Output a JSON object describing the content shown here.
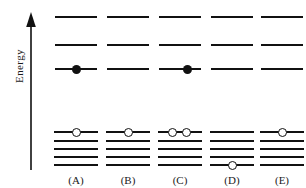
{
  "figure": {
    "type": "energy-level-diagram",
    "width": 306,
    "height": 188,
    "background_color": "#ffffff",
    "line_color": "#111111"
  },
  "axis": {
    "label": "Energy",
    "direction": "up",
    "arrow_icon": "up-arrow-icon"
  },
  "legend": {
    "filled_marker_meaning": "electron in upper level",
    "open_marker_meaning": "electron in lower level"
  },
  "levels": {
    "upper_count": 3,
    "lower_count": 5,
    "upper_y": [
      16,
      44,
      68
    ],
    "lower_y": [
      131,
      140,
      148,
      156,
      164
    ]
  },
  "columns": [
    {
      "id": "A",
      "caption": "(A)",
      "x": 6,
      "upper_electrons": [
        {
          "level_index": 2,
          "type": "filled",
          "offset_pct": 50
        }
      ],
      "lower_electrons": [
        {
          "level_index": 0,
          "type": "open",
          "offset_pct": 50
        }
      ]
    },
    {
      "id": "B",
      "caption": "(B)",
      "x": 58,
      "upper_electrons": [],
      "lower_electrons": [
        {
          "level_index": 0,
          "type": "open",
          "offset_pct": 50
        }
      ]
    },
    {
      "id": "C",
      "caption": "(C)",
      "x": 110,
      "upper_electrons": [
        {
          "level_index": 2,
          "type": "filled",
          "offset_pct": 64
        }
      ],
      "lower_electrons": [
        {
          "level_index": 0,
          "type": "open",
          "offset_pct": 36
        },
        {
          "level_index": 0,
          "type": "open",
          "offset_pct": 62
        }
      ]
    },
    {
      "id": "D",
      "caption": "(D)",
      "x": 162,
      "upper_electrons": [],
      "lower_electrons": [
        {
          "level_index": 4,
          "type": "open",
          "offset_pct": 50
        }
      ]
    },
    {
      "id": "E",
      "caption": "(E)",
      "x": 212,
      "upper_electrons": [],
      "lower_electrons": [
        {
          "level_index": 0,
          "type": "open",
          "offset_pct": 50
        }
      ]
    }
  ],
  "chart_data": {
    "type": "scatter",
    "title": "",
    "xlabel": "",
    "ylabel": "Energy",
    "grid": false,
    "legend_position": "none",
    "categories": [
      "(A)",
      "(B)",
      "(C)",
      "(D)",
      "(E)"
    ],
    "series": [
      {
        "name": "upper-level occupancy (filled)",
        "values": [
          1,
          0,
          1,
          0,
          0
        ]
      },
      {
        "name": "lower-level occupancy (open)",
        "values": [
          1,
          1,
          2,
          1,
          1
        ]
      }
    ],
    "per_option": [
      {
        "option": "(A)",
        "upper_levels": 3,
        "lower_levels": 5,
        "filled_on_upper_level": 3,
        "open_on_lower_level": 1,
        "open_count": 1
      },
      {
        "option": "(B)",
        "upper_levels": 3,
        "lower_levels": 5,
        "filled_on_upper_level": null,
        "open_on_lower_level": 1,
        "open_count": 1
      },
      {
        "option": "(C)",
        "upper_levels": 3,
        "lower_levels": 5,
        "filled_on_upper_level": 3,
        "open_on_lower_level": 1,
        "open_count": 2
      },
      {
        "option": "(D)",
        "upper_levels": 3,
        "lower_levels": 5,
        "filled_on_upper_level": null,
        "open_on_lower_level": 5,
        "open_count": 1
      },
      {
        "option": "(E)",
        "upper_levels": 3,
        "lower_levels": 5,
        "filled_on_upper_level": null,
        "open_on_lower_level": 1,
        "open_count": 1
      }
    ]
  }
}
